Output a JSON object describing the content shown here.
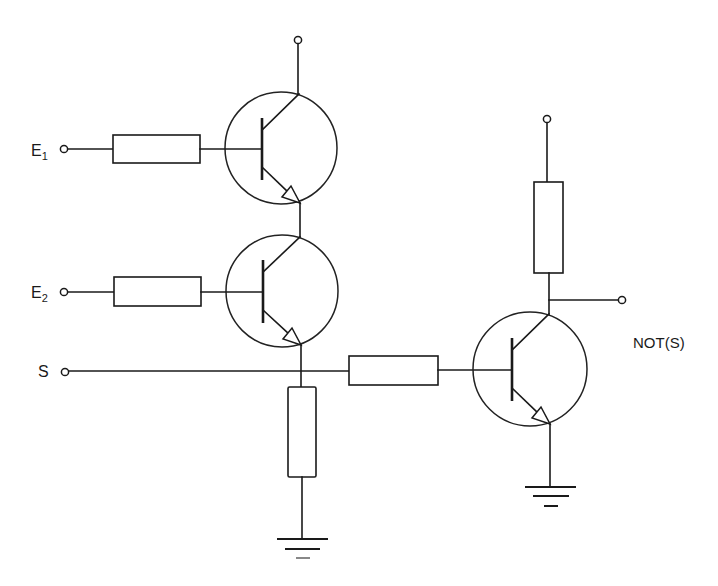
{
  "diagram": {
    "type": "circuit-schematic",
    "colors": {
      "line": "#1a1a1a",
      "background": "#ffffff"
    }
  },
  "labels": {
    "input1": {
      "main": "E",
      "sub": "1"
    },
    "input2": {
      "main": "E",
      "sub": "2"
    },
    "output_and": "S",
    "output_not": "NOT(S)"
  },
  "components": {
    "transistors": [
      {
        "id": "T1",
        "kind": "NPN",
        "role": "input E1 switch"
      },
      {
        "id": "T2",
        "kind": "NPN",
        "role": "input E2 switch"
      },
      {
        "id": "T3",
        "kind": "NPN",
        "role": "inverter"
      }
    ],
    "resistors": [
      {
        "id": "R1",
        "role": "E1 base resistor"
      },
      {
        "id": "R2",
        "role": "E2 base resistor"
      },
      {
        "id": "R3",
        "role": "S pull-down to ground"
      },
      {
        "id": "R4",
        "role": "T3 base resistor"
      },
      {
        "id": "R5",
        "role": "T3 collector load"
      }
    ],
    "grounds": [
      "G1",
      "G2"
    ],
    "terminals": [
      "VCC1",
      "VCC2",
      "E1",
      "E2",
      "S",
      "NOT_S"
    ]
  }
}
